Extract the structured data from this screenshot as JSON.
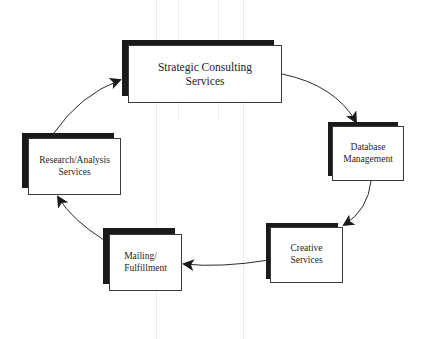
{
  "diagram": {
    "type": "cycle",
    "nodes": [
      {
        "id": "strategic",
        "label": "Strategic Consulting\nServices"
      },
      {
        "id": "database",
        "label": "Database\nManagement"
      },
      {
        "id": "creative",
        "label": "Creative\nServices"
      },
      {
        "id": "mailing",
        "label": "Mailing/\nFulfillment"
      },
      {
        "id": "research",
        "label": "Research/Analysis\nServices"
      }
    ],
    "edges": [
      {
        "from": "strategic",
        "to": "database"
      },
      {
        "from": "database",
        "to": "creative"
      },
      {
        "from": "creative",
        "to": "mailing"
      },
      {
        "from": "mailing",
        "to": "research"
      },
      {
        "from": "research",
        "to": "strategic"
      }
    ],
    "colors": {
      "line": "#2a2a2a",
      "shadow": "#1a1a1a",
      "box_fill": "#ffffff"
    }
  }
}
